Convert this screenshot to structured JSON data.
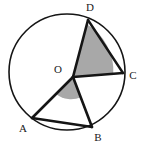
{
  "figure": {
    "kind": "circle-geometry-diagram",
    "width": 144,
    "height": 145,
    "background_color": "#ffffff",
    "stroke_color": "#151515",
    "shaded_sector_color": "#a8a8a8",
    "circle_stroke_width": 1.6,
    "chord_stroke_width": 2.4,
    "radius_stroke_width": 2.6
  },
  "circle": {
    "label": "circle",
    "center_x": 67,
    "center_y": 72,
    "radius": 58
  },
  "center_point": {
    "label": "O",
    "x": 73,
    "y": 77,
    "label_x": 58,
    "label_y": 70
  },
  "points": [
    {
      "label": "D",
      "x": 88,
      "y": 20,
      "label_x": 90,
      "label_y": 8
    },
    {
      "label": "C",
      "x": 123,
      "y": 73,
      "label_x": 133,
      "label_y": 76
    },
    {
      "label": "B",
      "x": 92,
      "y": 127,
      "label_x": 98,
      "label_y": 138
    },
    {
      "label": "A",
      "x": 32,
      "y": 118,
      "label_x": 23,
      "label_y": 129
    }
  ],
  "radii": [
    {
      "name": "radius-OD",
      "from": "O",
      "to": "D",
      "x1": 73,
      "y1": 77,
      "x2": 88,
      "y2": 20
    },
    {
      "name": "radius-OC",
      "from": "O",
      "to": "C",
      "x1": 73,
      "y1": 77,
      "x2": 123,
      "y2": 73
    },
    {
      "name": "radius-OB",
      "from": "O",
      "to": "B",
      "x1": 73,
      "y1": 77,
      "x2": 92,
      "y2": 127
    },
    {
      "name": "radius-OA",
      "from": "O",
      "to": "A",
      "x1": 73,
      "y1": 77,
      "x2": 32,
      "y2": 118
    }
  ],
  "chords": [
    {
      "name": "chord-DC",
      "from": "D",
      "to": "C",
      "x1": 88,
      "y1": 20,
      "x2": 123,
      "y2": 73
    },
    {
      "name": "chord-AB",
      "from": "A",
      "to": "B",
      "x1": 32,
      "y1": 118,
      "x2": 92,
      "y2": 127
    }
  ],
  "shaded_angles": [
    {
      "name": "angle-DOC",
      "vertex": "O",
      "arms": [
        "D",
        "C"
      ],
      "sector_path": "M 73 77 L 86.9 24.2 A 54.6 54.6 0 0 1 113.3 74.5 Z"
    },
    {
      "name": "angle-AOB",
      "vertex": "O",
      "arms": [
        "A",
        "B"
      ],
      "sector_path": "M 73 77 L 56.3 94.2 A 24 24 0 0 0 80.9 97.2 Z"
    }
  ]
}
